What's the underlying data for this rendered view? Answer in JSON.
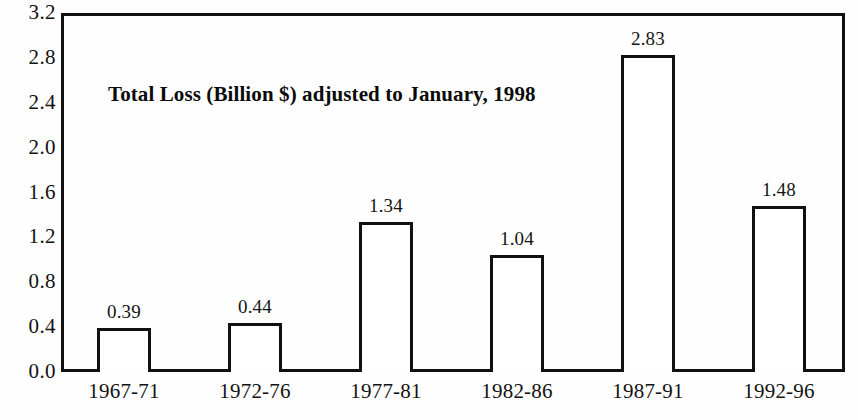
{
  "chart_data": {
    "type": "bar",
    "title": "Total Loss (Billion $) adjusted to January, 1998",
    "xlabel": "",
    "ylabel": "",
    "categories": [
      "1967-71",
      "1972-76",
      "1977-81",
      "1982-86",
      "1987-91",
      "1992-96"
    ],
    "values": [
      0.39,
      0.44,
      1.34,
      1.04,
      2.83,
      1.48
    ],
    "value_labels": [
      "0.39",
      "0.44",
      "1.34",
      "1.04",
      "2.83",
      "1.48"
    ],
    "ylim": [
      0.0,
      3.2
    ],
    "ytick_step": 0.4,
    "ytick_labels": [
      "3.2",
      "2.8",
      "2.4",
      "2.0",
      "1.6",
      "1.2",
      "0.8",
      "0.4",
      "0.0"
    ],
    "ytick_values": [
      3.2,
      2.8,
      2.4,
      2.0,
      1.6,
      1.2,
      0.8,
      0.4,
      0.0
    ],
    "grid": false,
    "legend": false,
    "bar_fill_color": "#ffffff",
    "bar_edge_color": "#111111",
    "axis_color": "#111111",
    "background_color": "#fefefe",
    "text_color": "#121212"
  }
}
